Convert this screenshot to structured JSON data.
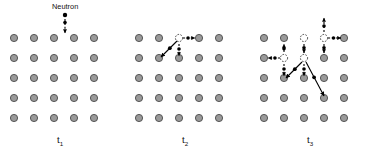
{
  "figure": {
    "title_text": "Neutron",
    "background_color": "#ffffff",
    "atom_fill": "#9a9a9a",
    "atom_stroke": "#4a4a4a",
    "vacancy_stroke": "#333333",
    "arrow_color": "#000000",
    "trajectory_color": "#000000",
    "neutron_color": "#000000",
    "atom_radius": 3.6,
    "vacancy_radius": 3.6,
    "grid": {
      "columns": 5,
      "rows": 5,
      "spacing_x": 20,
      "spacing_y": 20
    }
  },
  "panels": [
    {
      "id": "panel-t1",
      "label": "t",
      "subscript": "1",
      "label_x": 57,
      "label_y": 143,
      "origin_x": 14,
      "origin_y": 38,
      "caption": "Incident neutron approaching undisturbed lattice",
      "vacancies": [],
      "displaced_atoms": [],
      "neutron": {
        "label": "Neutron",
        "label_x": 52,
        "label_y": 9,
        "dot_x": 65,
        "dot_y": 15
      },
      "arrows": [
        {
          "name": "neutron-incoming-arrow",
          "x1": 65,
          "x2": 65,
          "y1": 15,
          "y2": 33,
          "style": "dashed"
        }
      ],
      "trajectories": []
    },
    {
      "id": "panel-t2",
      "label": "t",
      "subscript": "2",
      "label_x": 182,
      "label_y": 143,
      "origin_x": 139,
      "origin_y": 38,
      "caption": "First knock-on atom displaced, vacancy created",
      "vacancies": [
        {
          "name": "vacancy-r0c2",
          "cx": 179,
          "cy": 38
        }
      ],
      "displaced_atoms": [],
      "neutron": null,
      "arrows": [
        {
          "name": "interstitial-right-arrow",
          "x1": 183,
          "x2": 195,
          "y1": 38,
          "y2": 38,
          "style": "dashed"
        },
        {
          "name": "interstitial-down-arrow",
          "x1": 179,
          "x2": 179,
          "y1": 44,
          "y2": 56,
          "style": "dashed"
        }
      ],
      "trajectories": [
        {
          "name": "recoil-track-down-left",
          "x1": 177,
          "x2": 161,
          "y1": 41,
          "y2": 57
        }
      ]
    },
    {
      "id": "panel-t3",
      "label": "t",
      "subscript": "3",
      "label_x": 307,
      "label_y": 143,
      "origin_x": 264,
      "origin_y": 38,
      "caption": "Collision cascade with multiple vacancies and interstitials",
      "vacancies": [
        {
          "name": "vacancy-r0c2",
          "cx": 304,
          "cy": 38
        },
        {
          "name": "vacancy-r0c3",
          "cx": 324,
          "cy": 38
        },
        {
          "name": "vacancy-r1c1",
          "cx": 284,
          "cy": 58
        },
        {
          "name": "vacancy-r1c2",
          "cx": 304,
          "cy": 58
        }
      ],
      "displaced_atoms": [],
      "neutron": null,
      "arrows": [
        {
          "name": "interstitial-up-arrow-c3",
          "x1": 324,
          "x2": 324,
          "y1": 32,
          "y2": 18,
          "style": "dashed"
        },
        {
          "name": "interstitial-right-arrow-c3",
          "x1": 328,
          "x2": 341,
          "y1": 38,
          "y2": 38,
          "style": "dashed"
        },
        {
          "name": "interstitial-down-arrow-c2-top",
          "x1": 304,
          "x2": 304,
          "y1": 44,
          "y2": 53,
          "style": "dashed"
        },
        {
          "name": "interstitial-down-arrow-c3-top",
          "x1": 324,
          "x2": 324,
          "y1": 44,
          "y2": 53,
          "style": "dashed"
        },
        {
          "name": "interstitial-left-arrow-c1",
          "x1": 280,
          "x2": 268,
          "y1": 58,
          "y2": 58,
          "style": "dashed"
        },
        {
          "name": "interstitial-down-arrow-c1",
          "x1": 284,
          "x2": 284,
          "y1": 64,
          "y2": 76,
          "style": "dashed"
        },
        {
          "name": "interstitial-down-arrow-c2-mid",
          "x1": 304,
          "x2": 304,
          "y1": 64,
          "y2": 76,
          "style": "dashed"
        },
        {
          "name": "interstitial-up-arrow-c1",
          "x1": 284,
          "x2": 284,
          "y1": 52,
          "y2": 44,
          "style": "dashed"
        }
      ],
      "trajectories": [
        {
          "name": "cascade-branch-left",
          "x1": 302,
          "x2": 286,
          "y1": 62,
          "y2": 78
        },
        {
          "name": "cascade-branch-right",
          "x1": 306,
          "x2": 324,
          "y1": 62,
          "y2": 96
        }
      ]
    }
  ]
}
